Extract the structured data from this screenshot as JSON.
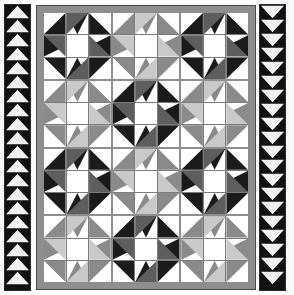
{
  "image": {
    "title": "Quilt block layout diagram",
    "width": 294,
    "height": 295,
    "background_color": "#ffffff"
  },
  "palette": {
    "white": "#ffffff",
    "light_gray": "#c9c9c9",
    "medium_gray": "#8a8a8a",
    "dark_gray": "#5e5e5e",
    "black": "#1b1b1b",
    "sashing_gray": "#8e8e8e",
    "border_black": "#111111"
  },
  "borders": {
    "left": {
      "name": "sawtooth-border-left",
      "direction": "up",
      "tooth_color": "#f4f4f4",
      "background_color": "#111111",
      "tooth_count": 20
    },
    "right": {
      "name": "sawtooth-border-right",
      "direction": "down",
      "tooth_color": "#f4f4f4",
      "background_color": "#111111",
      "tooth_count": 20
    }
  },
  "quilt": {
    "name": "quilt-body",
    "sashing_color": "#8e8e8e",
    "rows": 4,
    "columns": 3,
    "block_type": "star-pinwheel",
    "grid": [
      [
        "black",
        "gray",
        "black"
      ],
      [
        "gray",
        "black",
        "gray"
      ],
      [
        "black",
        "gray",
        "black"
      ],
      [
        "gray",
        "black",
        "gray"
      ]
    ]
  }
}
